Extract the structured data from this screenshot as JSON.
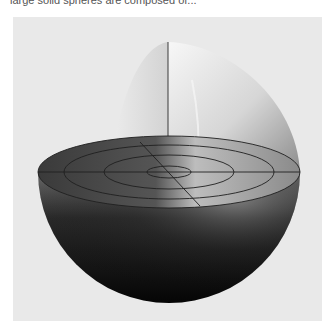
{
  "caption": {
    "text": "large solid spheres are composed of..."
  },
  "figure": {
    "background_color": "#e9e9e9",
    "colors": {
      "shell_dark": "#0a0a0a",
      "shell_light": "#f2f2f2",
      "ring_line": "#222222"
    }
  }
}
